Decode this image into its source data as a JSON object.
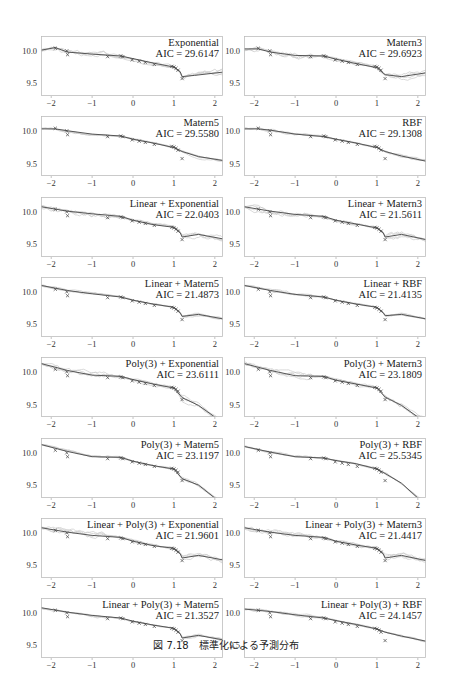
{
  "caption": "図 7.18　標準化による予測分布",
  "chart_data": {
    "type": "line",
    "layout": "8 rows x 2 columns of small-multiple panels",
    "xlabel": "",
    "ylabel": "",
    "xlim": [
      -2.25,
      2.2
    ],
    "ylim": [
      9.32,
      10.25
    ],
    "xticks": [
      "-2",
      "-1",
      "0",
      "1",
      "2"
    ],
    "yticks": [
      "9.5",
      "10.0"
    ],
    "grid": false,
    "legend": "none; each panel annotated top-right with kernel name and AIC",
    "observations": {
      "marker": "x",
      "x": [
        -1.9,
        -1.62,
        -1.6,
        -0.62,
        -0.3,
        -0.25,
        -0.02,
        0.15,
        0.3,
        0.52,
        0.95,
        1.0,
        1.05,
        1.1,
        1.2
      ],
      "y": [
        10.06,
        10.02,
        9.96,
        9.93,
        9.94,
        9.93,
        9.88,
        9.86,
        9.84,
        9.81,
        9.78,
        9.77,
        9.75,
        9.72,
        9.59
      ]
    },
    "panels": [
      {
        "kernel": "Exponential",
        "aic": "AIC =  29.6147",
        "mean_x": [
          -2.25,
          -1.9,
          -1.6,
          -1,
          -0.3,
          0,
          0.5,
          1,
          1.15,
          1.2,
          1.5,
          2.2
        ],
        "mean_y": [
          10.03,
          10.07,
          10.0,
          9.97,
          9.94,
          9.9,
          9.83,
          9.77,
          9.7,
          9.62,
          9.64,
          9.69
        ]
      },
      {
        "kernel": "Matern3",
        "aic": "AIC =  29.6923",
        "mean_x": [
          -2.25,
          -1.9,
          -1.6,
          -1,
          -0.3,
          0,
          0.5,
          1,
          1.2,
          1.6,
          2.2
        ],
        "mean_y": [
          10.05,
          10.05,
          10.0,
          9.95,
          9.94,
          9.89,
          9.82,
          9.76,
          9.65,
          9.62,
          9.68
        ]
      },
      {
        "kernel": "Matern5",
        "aic": "AIC =  29.5580",
        "mean_x": [
          -2.25,
          -1.9,
          -1.6,
          -1,
          -0.3,
          0,
          0.5,
          1,
          1.2,
          1.6,
          2.2
        ],
        "mean_y": [
          10.05,
          10.05,
          10.02,
          9.97,
          9.94,
          9.89,
          9.83,
          9.76,
          9.7,
          9.62,
          9.56
        ]
      },
      {
        "kernel": "RBF",
        "aic": "AIC =  29.1308",
        "mean_x": [
          -2.25,
          -1.9,
          -1.6,
          -1,
          -0.3,
          0,
          0.5,
          1,
          1.2,
          1.6,
          2.2
        ],
        "mean_y": [
          10.05,
          10.05,
          10.03,
          9.97,
          9.93,
          9.89,
          9.83,
          9.76,
          9.7,
          9.63,
          9.55
        ]
      },
      {
        "kernel": "Linear + Exponential",
        "aic": "AIC =  22.0403",
        "mean_x": [
          -2.25,
          -1.6,
          -1,
          -0.3,
          0,
          0.5,
          1,
          1.15,
          1.2,
          1.6,
          2.2
        ],
        "mean_y": [
          10.1,
          10.03,
          9.99,
          9.95,
          9.89,
          9.82,
          9.78,
          9.7,
          9.63,
          9.67,
          9.6
        ]
      },
      {
        "kernel": "Linear + Matern3",
        "aic": "AIC =  21.5611",
        "mean_x": [
          -2.25,
          -1.6,
          -1,
          -0.3,
          0,
          0.5,
          1,
          1.15,
          1.2,
          1.6,
          2.2
        ],
        "mean_y": [
          10.1,
          10.03,
          9.98,
          9.95,
          9.89,
          9.83,
          9.77,
          9.7,
          9.63,
          9.67,
          9.59
        ]
      },
      {
        "kernel": "Linear + Matern5",
        "aic": "AIC =  21.4873",
        "mean_x": [
          -2.25,
          -1.6,
          -1,
          -0.3,
          0,
          0.5,
          1,
          1.15,
          1.2,
          1.6,
          2.2
        ],
        "mean_y": [
          10.12,
          10.04,
          9.99,
          9.94,
          9.89,
          9.83,
          9.78,
          9.7,
          9.64,
          9.67,
          9.6
        ]
      },
      {
        "kernel": "Linear + RBF",
        "aic": "AIC =  21.4135",
        "mean_x": [
          -2.25,
          -1.6,
          -1,
          -0.3,
          0,
          0.5,
          1,
          1.15,
          1.2,
          1.6,
          2.2
        ],
        "mean_y": [
          10.12,
          10.04,
          9.98,
          9.94,
          9.89,
          9.83,
          9.78,
          9.7,
          9.65,
          9.67,
          9.6
        ]
      },
      {
        "kernel": "Poly(3) + Exponential",
        "aic": "AIC =  23.6111",
        "mean_x": [
          -2.25,
          -1.6,
          -1,
          -0.3,
          0,
          0.5,
          1,
          1.2,
          1.6,
          2.0,
          2.2
        ],
        "mean_y": [
          10.15,
          10.04,
          9.97,
          9.95,
          9.9,
          9.83,
          9.77,
          9.62,
          9.5,
          9.32,
          9.25
        ]
      },
      {
        "kernel": "Poly(3) + Matern3",
        "aic": "AIC =  23.1809",
        "mean_x": [
          -2.25,
          -1.6,
          -1,
          -0.3,
          0,
          0.5,
          1,
          1.2,
          1.6,
          2.0,
          2.2
        ],
        "mean_y": [
          10.15,
          10.04,
          9.96,
          9.95,
          9.89,
          9.83,
          9.77,
          9.63,
          9.5,
          9.32,
          9.25
        ]
      },
      {
        "kernel": "Poly(3) + Matern5",
        "aic": "AIC =  23.1197",
        "mean_x": [
          -2.25,
          -1.6,
          -1,
          -0.3,
          0,
          0.5,
          1,
          1.2,
          1.6,
          2.0,
          2.2
        ],
        "mean_y": [
          10.15,
          10.04,
          9.96,
          9.95,
          9.89,
          9.82,
          9.77,
          9.62,
          9.52,
          9.32,
          9.25
        ]
      },
      {
        "kernel": "Poly(3) + RBF",
        "aic": "AIC =  25.5345",
        "mean_x": [
          -2.25,
          -1.6,
          -1,
          -0.3,
          0,
          0.5,
          1,
          1.2,
          1.6,
          2.0,
          2.2
        ],
        "mean_y": [
          10.12,
          10.03,
          9.96,
          9.94,
          9.9,
          9.85,
          9.77,
          9.7,
          9.55,
          9.32,
          9.25
        ]
      },
      {
        "kernel": "Linear + Poly(3) + Exponential",
        "aic": "AIC =  21.9601",
        "mean_x": [
          -2.25,
          -1.6,
          -1,
          -0.3,
          0,
          0.5,
          1,
          1.15,
          1.2,
          1.6,
          2.2
        ],
        "mean_y": [
          10.1,
          10.03,
          9.98,
          9.95,
          9.89,
          9.82,
          9.78,
          9.7,
          9.63,
          9.67,
          9.6
        ]
      },
      {
        "kernel": "Linear + Poly(3) + Matern3",
        "aic": "AIC =  21.4417",
        "mean_x": [
          -2.25,
          -1.6,
          -1,
          -0.3,
          0,
          0.5,
          1,
          1.15,
          1.2,
          1.6,
          2.2
        ],
        "mean_y": [
          10.1,
          10.03,
          9.98,
          9.95,
          9.89,
          9.83,
          9.78,
          9.7,
          9.63,
          9.67,
          9.59
        ]
      },
      {
        "kernel": "Linear + Poly(3) + Matern5",
        "aic": "AIC =  21.3527",
        "mean_x": [
          -2.25,
          -1.6,
          -1,
          -0.3,
          0,
          0.5,
          1,
          1.15,
          1.2,
          1.6,
          2.2
        ],
        "mean_y": [
          10.1,
          10.03,
          9.98,
          9.94,
          9.89,
          9.83,
          9.78,
          9.7,
          9.63,
          9.67,
          9.6
        ]
      },
      {
        "kernel": "Linear + Poly(3) + RBF",
        "aic": "AIC =  24.1457",
        "mean_x": [
          -2.25,
          -1.6,
          -1,
          -0.3,
          0,
          0.5,
          1,
          1.2,
          1.6,
          2.2
        ],
        "mean_y": [
          10.08,
          10.04,
          9.99,
          9.94,
          9.9,
          9.84,
          9.77,
          9.72,
          9.66,
          9.58
        ]
      }
    ]
  }
}
